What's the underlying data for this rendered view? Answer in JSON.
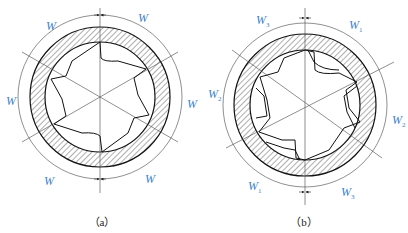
{
  "figure_a": {
    "caption": "（a）",
    "labels": [
      {
        "id": "top-left",
        "text": "W",
        "sub": ""
      },
      {
        "id": "top-right",
        "text": "W",
        "sub": ""
      },
      {
        "id": "left",
        "text": "W",
        "sub": ""
      },
      {
        "id": "right",
        "text": "W",
        "sub": ""
      },
      {
        "id": "bottom-left",
        "text": "W",
        "sub": ""
      },
      {
        "id": "bottom-right",
        "text": "W",
        "sub": ""
      }
    ]
  },
  "figure_b": {
    "caption": "（b）",
    "labels": [
      {
        "id": "top-left",
        "text": "W",
        "sub": "3"
      },
      {
        "id": "top-right",
        "text": "W",
        "sub": "1"
      },
      {
        "id": "left",
        "text": "W",
        "sub": "2"
      },
      {
        "id": "right",
        "text": "W",
        "sub": "2"
      },
      {
        "id": "bottom-left",
        "text": "W",
        "sub": "1"
      },
      {
        "id": "bottom-right",
        "text": "W",
        "sub": "3"
      }
    ]
  },
  "colors": {
    "label": "#3a7fd0",
    "line": "#222222"
  }
}
